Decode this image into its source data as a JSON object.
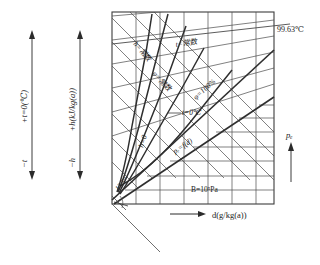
{
  "figure": {
    "kind": "psychrometric-h-d-chart",
    "axes": {
      "x_axis_label": "d(g/kg(a))",
      "x_axis_arrow": "arrow-right-icon",
      "left_axis_1": {
        "positive_label": "+t=0(℃)",
        "negative_label": "−t",
        "arrow": "double-arrow-vertical-icon"
      },
      "left_axis_2": {
        "positive_label": "+h(kJ/kg(a))",
        "negative_label": "−h",
        "arrow": "double-arrow-vertical-icon"
      },
      "right_axis": {
        "label": "pₑ",
        "arrow": "arrow-up-icon"
      }
    },
    "annotations": [
      {
        "name": "h-constant-label",
        "text": "h=常数"
      },
      {
        "name": "t-constant-label",
        "text": "t=常数"
      },
      {
        "name": "phi-constant-label",
        "text": "φ=常数"
      },
      {
        "name": "phi-100-label",
        "text": "φ=100%"
      },
      {
        "name": "t-zero-label",
        "text": "t=0℃"
      },
      {
        "name": "h-zero-label",
        "text": "h=0"
      },
      {
        "name": "ps-fd-label",
        "text": "pₑ=f(d)"
      },
      {
        "name": "barometric-label",
        "text": "B=10⁵Pa"
      },
      {
        "name": "angle-label",
        "text": "13.5°"
      },
      {
        "name": "saturation-temp-label",
        "text": "99.63℃"
      }
    ],
    "colors": {
      "line": "#3c3c3c",
      "frame": "#3c3c3c",
      "text": "#1a1a1a",
      "background": "#ffffff"
    }
  }
}
